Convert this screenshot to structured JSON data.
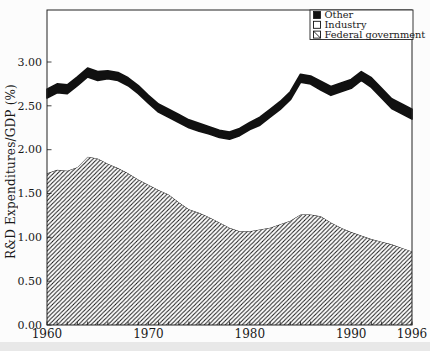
{
  "chart_data": {
    "type": "area",
    "stacked": true,
    "title": "",
    "xlabel": "",
    "ylabel": "R&D Expenditures/GDP (%)",
    "x_range": [
      1960,
      1996
    ],
    "y_range": [
      0,
      3.6
    ],
    "grid": false,
    "years": [
      1960,
      1961,
      1962,
      1963,
      1964,
      1965,
      1966,
      1967,
      1968,
      1969,
      1970,
      1971,
      1972,
      1973,
      1974,
      1975,
      1976,
      1977,
      1978,
      1979,
      1980,
      1981,
      1982,
      1983,
      1984,
      1985,
      1986,
      1987,
      1988,
      1989,
      1990,
      1991,
      1992,
      1993,
      1994,
      1995,
      1996
    ],
    "series": [
      {
        "name": "Federal government",
        "fill": "hatch",
        "values": [
          1.73,
          1.77,
          1.76,
          1.8,
          1.92,
          1.9,
          1.84,
          1.79,
          1.73,
          1.66,
          1.6,
          1.54,
          1.49,
          1.4,
          1.32,
          1.28,
          1.23,
          1.17,
          1.11,
          1.07,
          1.07,
          1.09,
          1.11,
          1.15,
          1.19,
          1.26,
          1.26,
          1.24,
          1.17,
          1.11,
          1.06,
          1.02,
          0.98,
          0.95,
          0.92,
          0.88,
          0.84
        ]
      },
      {
        "name": "Industry",
        "fill": "white",
        "values": [
          0.86,
          0.88,
          0.88,
          0.93,
          0.91,
          0.89,
          0.97,
          1.0,
          1.0,
          0.98,
          0.93,
          0.89,
          0.88,
          0.91,
          0.93,
          0.93,
          0.95,
          0.97,
          1.01,
          1.09,
          1.16,
          1.19,
          1.26,
          1.31,
          1.38,
          1.51,
          1.49,
          1.44,
          1.45,
          1.55,
          1.64,
          1.77,
          1.73,
          1.64,
          1.55,
          1.53,
          1.51
        ]
      },
      {
        "name": "Other",
        "fill": "black",
        "values": [
          0.1,
          0.1,
          0.1,
          0.1,
          0.1,
          0.1,
          0.09,
          0.09,
          0.09,
          0.09,
          0.09,
          0.09,
          0.09,
          0.09,
          0.09,
          0.09,
          0.08,
          0.08,
          0.08,
          0.08,
          0.08,
          0.09,
          0.09,
          0.09,
          0.09,
          0.09,
          0.09,
          0.1,
          0.1,
          0.1,
          0.1,
          0.1,
          0.11,
          0.11,
          0.11,
          0.11,
          0.11
        ]
      }
    ],
    "y_ticks": [
      "0.00",
      "0.50",
      "1.00",
      "1.50",
      "2.00",
      "2.50",
      "3.00"
    ],
    "x_ticks_labeled": [
      1960,
      1970,
      1980,
      1990,
      1996
    ],
    "x_minor_tick_interval": 1,
    "legend": {
      "position": "top-right",
      "entries": [
        {
          "label": "Other",
          "swatch": "black"
        },
        {
          "label": "Industry",
          "swatch": "white"
        },
        {
          "label": "Federal government",
          "swatch": "hatch"
        }
      ]
    },
    "colors": {
      "ink": "#161616",
      "frame": "#222222",
      "background": "#ffffff"
    }
  }
}
